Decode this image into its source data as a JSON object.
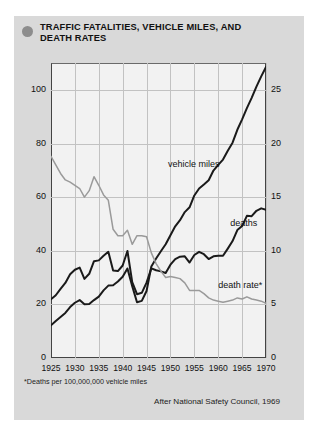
{
  "card": {
    "bullet_icon": "filled-circle-bullet",
    "title": "TRAFFIC FATALITIES, VEHICLE MILES, AND DEATH RATES"
  },
  "headers": {
    "left_line1": "Vehicle miles (in 10 billions)",
    "left_line2": "Deaths (in 1000s)",
    "right": "Death rate"
  },
  "footnote": "*Deaths per 100,000,000 vehicle miles",
  "attribution": "After National Safety Council, 1969",
  "colors": {
    "card_bg": "#d9d9d9",
    "plot_bg": "#f2f2f2",
    "grid": "#c2c2c2",
    "frame": "#444444",
    "series_black": "#1a1a1a",
    "series_gray": "#9a9a9a",
    "bullet": "#8d8d8d"
  },
  "chart_data": {
    "type": "line",
    "title": "TRAFFIC FATALITIES, VEHICLE MILES, AND DEATH RATES",
    "xlabel": "",
    "ylabel": "Vehicle miles (in 10 billions) / Deaths (in 1000s)",
    "y2label": "Death rate",
    "xlim": [
      1925,
      1970
    ],
    "ylim": [
      0,
      110
    ],
    "y2lim": [
      0,
      27.5
    ],
    "grid": true,
    "legend": "inline-annotations",
    "xticks": [
      1925,
      1930,
      1935,
      1940,
      1945,
      1950,
      1955,
      1960,
      1965,
      1970
    ],
    "yticks": [
      0,
      20,
      40,
      60,
      80,
      100
    ],
    "y2ticks": [
      0,
      5,
      10,
      15,
      20,
      25
    ],
    "y_corner_left": "0",
    "y_corner_right": "0",
    "annotations": [
      {
        "text": "vehicle miles",
        "x": 1949.5,
        "y": 72
      },
      {
        "text": "deaths",
        "x": 1962.5,
        "y": 50
      },
      {
        "text": "death rate*",
        "x": 1960.0,
        "y": 27
      }
    ],
    "series": [
      {
        "name": "vehicle miles",
        "axis": "left",
        "color": "#1a1a1a",
        "x": [
          1925,
          1926,
          1927,
          1928,
          1929,
          1930,
          1931,
          1932,
          1933,
          1934,
          1935,
          1936,
          1937,
          1938,
          1939,
          1940,
          1941,
          1942,
          1943,
          1944,
          1945,
          1946,
          1947,
          1948,
          1949,
          1950,
          1951,
          1952,
          1953,
          1954,
          1955,
          1956,
          1957,
          1958,
          1959,
          1960,
          1961,
          1962,
          1963,
          1964,
          1965,
          1966,
          1967,
          1968,
          1969,
          1970
        ],
        "values": [
          12.2,
          13.8,
          15.3,
          16.8,
          19.0,
          20.6,
          21.6,
          20.0,
          20.1,
          21.6,
          22.9,
          25.2,
          27.0,
          27.1,
          28.5,
          30.3,
          33.4,
          26.8,
          20.8,
          21.3,
          25.0,
          34.1,
          37.1,
          39.8,
          42.4,
          45.8,
          49.1,
          51.4,
          54.4,
          56.2,
          60.6,
          63.2,
          64.7,
          66.3,
          69.9,
          72.0,
          74.0,
          77.3,
          80.3,
          85.1,
          89.0,
          93.2,
          97.0,
          101.2,
          105.0,
          108.5
        ]
      },
      {
        "name": "deaths",
        "axis": "left",
        "color": "#1a1a1a",
        "x": [
          1925,
          1926,
          1927,
          1928,
          1929,
          1930,
          1931,
          1932,
          1933,
          1934,
          1935,
          1936,
          1937,
          1938,
          1939,
          1940,
          1941,
          1942,
          1943,
          1944,
          1945,
          1946,
          1947,
          1948,
          1949,
          1950,
          1951,
          1952,
          1953,
          1954,
          1955,
          1956,
          1957,
          1958,
          1959,
          1960,
          1961,
          1962,
          1963,
          1964,
          1965,
          1966,
          1967,
          1968,
          1969,
          1970
        ],
        "values": [
          21.9,
          23.4,
          25.8,
          28.0,
          31.2,
          32.9,
          33.7,
          29.5,
          31.4,
          36.1,
          36.4,
          38.1,
          39.6,
          32.6,
          32.4,
          34.5,
          39.9,
          28.3,
          23.8,
          24.3,
          28.1,
          33.4,
          32.7,
          32.3,
          31.7,
          34.8,
          36.9,
          37.8,
          37.9,
          35.6,
          38.4,
          39.6,
          38.7,
          36.9,
          37.9,
          38.1,
          38.1,
          40.8,
          43.6,
          47.7,
          49.2,
          53.0,
          52.9,
          54.9,
          55.8,
          55.3
        ]
      },
      {
        "name": "death rate",
        "axis": "right",
        "color": "#9a9a9a",
        "x": [
          1925,
          1926,
          1927,
          1928,
          1929,
          1930,
          1931,
          1932,
          1933,
          1934,
          1935,
          1936,
          1937,
          1938,
          1939,
          1940,
          1941,
          1942,
          1943,
          1944,
          1945,
          1946,
          1947,
          1948,
          1949,
          1950,
          1951,
          1952,
          1953,
          1954,
          1955,
          1956,
          1957,
          1958,
          1959,
          1960,
          1961,
          1962,
          1963,
          1964,
          1965,
          1966,
          1967,
          1968,
          1969,
          1970
        ],
        "values": [
          18.8,
          18.0,
          17.2,
          16.6,
          16.4,
          16.1,
          15.8,
          15.0,
          15.6,
          16.9,
          16.1,
          15.2,
          14.7,
          12.0,
          11.4,
          11.4,
          11.9,
          10.6,
          11.4,
          11.4,
          11.3,
          9.8,
          8.8,
          8.1,
          7.5,
          7.6,
          7.5,
          7.4,
          7.0,
          6.3,
          6.3,
          6.3,
          6.0,
          5.6,
          5.4,
          5.3,
          5.2,
          5.3,
          5.4,
          5.6,
          5.5,
          5.7,
          5.5,
          5.4,
          5.3,
          5.1
        ]
      }
    ]
  }
}
